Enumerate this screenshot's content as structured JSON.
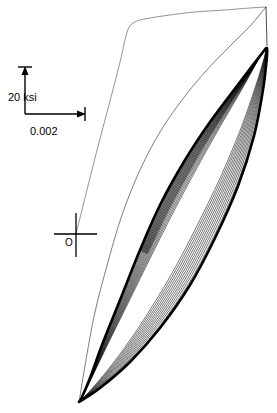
{
  "figure": {
    "background_color": "#ffffff",
    "line_color": "#000000",
    "width": 277,
    "height": 413
  },
  "scale_legend": {
    "name": "scale-bar",
    "vertical_label": "20 ksi",
    "horizontal_label": "0.002",
    "corner_x": 25,
    "corner_y": 114,
    "vertical_top_y": 68,
    "horizontal_right_x": 86,
    "vertical_label_x": 8,
    "vertical_label_y": 100,
    "horizontal_label_x": 30,
    "horizontal_label_y": 131
  },
  "origin_marker": {
    "name": "origin-crosshair",
    "label": "O",
    "center_x": 76,
    "center_y": 234,
    "h_left": 54,
    "h_right": 96,
    "v_top": 214,
    "v_bottom": 256,
    "label_x": 66,
    "label_y": 245
  },
  "chart_data": {
    "type": "line",
    "xlabel": "Strain",
    "ylabel": "Stress",
    "grid": false,
    "legend_position": "none",
    "axis_units": {
      "x": "strain (unitless)",
      "y": "ksi"
    },
    "scale_bar": {
      "x_span_value": 0.002,
      "x_span_px": 61,
      "y_span_value": 20,
      "y_span_px": 46,
      "y_span_unit": "ksi"
    },
    "origin_px": {
      "x": 76,
      "y": 234
    },
    "annotations": [
      {
        "text": "20 ksi",
        "role": "vertical-scale"
      },
      {
        "text": "0.002",
        "role": "horizontal-scale"
      },
      {
        "text": "O",
        "role": "origin"
      }
    ],
    "series": [
      {
        "name": "initial-monotonic-loading",
        "style": "thin",
        "stroke_width": 0.5,
        "points_px": [
          [
            76,
            234
          ],
          [
            95,
            158
          ],
          [
            110,
            101
          ],
          [
            120,
            62
          ],
          [
            126,
            36
          ],
          [
            130,
            26
          ],
          [
            137,
            21
          ],
          [
            150,
            18
          ],
          [
            170,
            15
          ],
          [
            195,
            12
          ],
          [
            225,
            10
          ],
          [
            250,
            8
          ],
          [
            266,
            7
          ]
        ]
      },
      {
        "name": "loop-envelope-outer-left-branch",
        "style": "thick",
        "stroke_width": 2.6,
        "points_px": [
          [
            266,
            48
          ],
          [
            240,
            82
          ],
          [
            210,
            122
          ],
          [
            185,
            160
          ],
          [
            160,
            205
          ],
          [
            140,
            250
          ],
          [
            120,
            300
          ],
          [
            102,
            345
          ],
          [
            90,
            378
          ],
          [
            82,
            397
          ],
          [
            79,
            402
          ]
        ]
      },
      {
        "name": "loop-envelope-outer-right-branch",
        "style": "thick",
        "stroke_width": 2.6,
        "points_px": [
          [
            79,
            402
          ],
          [
            100,
            388
          ],
          [
            130,
            362
          ],
          [
            160,
            328
          ],
          [
            190,
            285
          ],
          [
            215,
            238
          ],
          [
            238,
            186
          ],
          [
            254,
            136
          ],
          [
            263,
            90
          ],
          [
            267,
            56
          ],
          [
            267,
            48
          ]
        ]
      },
      {
        "name": "inner-loops",
        "style": "thin-nested",
        "count": 12,
        "stroke_width": 0.6,
        "description": "Nested hysteresis loops contracting toward the stable saturated loop; all share the upper apex near (266,48) and lower apex near (80,401)."
      }
    ],
    "loop_count": 14,
    "upper_apex_px": [
      266,
      48
    ],
    "lower_apex_px": [
      80,
      401
    ]
  }
}
